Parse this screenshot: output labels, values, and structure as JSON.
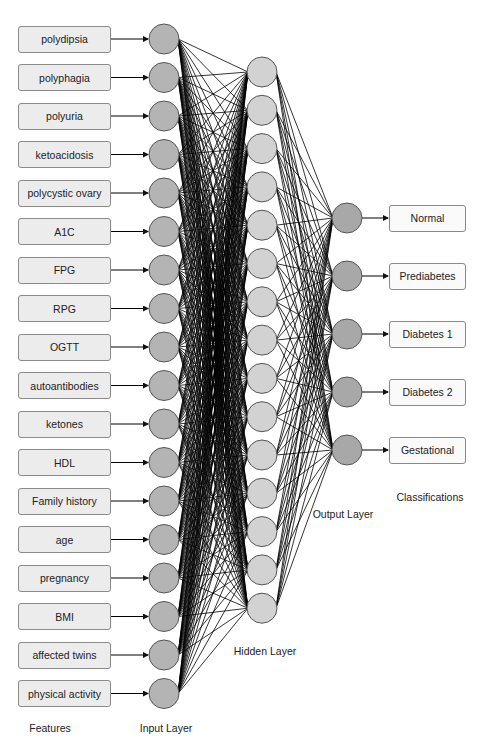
{
  "figure": {
    "colors": {
      "background": "#ffffff",
      "feature_box_fill": "#ececec",
      "class_box_fill": "#fafafa",
      "box_border": "#8a8a8a",
      "input_node_fill": "#b4b4b4",
      "hidden_node_fill": "#d2d2d2",
      "output_node_fill": "#a8a8a8",
      "node_border": "#555555",
      "edge": "#000000",
      "text": "#222222"
    },
    "features": [
      "polydipsia",
      "polyphagia",
      "polyuria",
      "ketoacidosis",
      "polycystic ovary",
      "A1C",
      "FPG",
      "RPG",
      "OGTT",
      "autoantibodies",
      "ketones",
      "HDL",
      "Family history",
      "age",
      "pregnancy",
      "BMI",
      "affected twins",
      "physical activity"
    ],
    "classifications": [
      "Normal",
      "Prediabetes",
      "Diabetes 1",
      "Diabetes 2",
      "Gestational"
    ],
    "layers": {
      "input": {
        "count": 18,
        "label": "Input Layer"
      },
      "hidden": {
        "count": 15,
        "label": "Hidden Layer"
      },
      "output": {
        "count": 5,
        "label": "Output Layer"
      }
    },
    "labels": {
      "features": "Features",
      "input_layer": "Input Layer",
      "hidden_layer": "Hidden Layer",
      "output_layer": "Output Layer",
      "classifications": "Classifications"
    }
  }
}
